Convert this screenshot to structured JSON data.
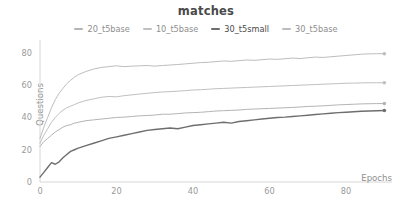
{
  "chart_data": {
    "type": "line",
    "title": "matches",
    "xlabel": "Epochs",
    "ylabel": "Questions",
    "xlim": [
      0,
      92
    ],
    "ylim": [
      0,
      88
    ],
    "xticks": [
      0,
      20,
      40,
      60,
      80
    ],
    "yticks": [
      0,
      20,
      40,
      60,
      80
    ],
    "grid": false,
    "legend_position": "top-center",
    "endpoint_markers": true,
    "series": [
      {
        "name": "20_t5base",
        "color": "#b4b4b4",
        "width": 1.0,
        "x": [
          0,
          1,
          2,
          3,
          4,
          5,
          6,
          7,
          8,
          9,
          10,
          12,
          14,
          16,
          18,
          20,
          22,
          24,
          26,
          28,
          30,
          32,
          34,
          36,
          38,
          40,
          42,
          44,
          46,
          48,
          50,
          52,
          54,
          56,
          58,
          60,
          62,
          64,
          66,
          68,
          70,
          72,
          74,
          76,
          78,
          80,
          82,
          84,
          86,
          88,
          90
        ],
        "values": [
          22,
          25,
          27,
          29,
          31,
          32.5,
          34,
          35,
          35.5,
          36.5,
          37,
          38,
          38.5,
          39,
          39.5,
          40,
          40.2,
          40.6,
          41,
          41.2,
          41.5,
          42,
          42,
          42.4,
          42.8,
          43,
          43.2,
          43.6,
          44,
          44.2,
          44.4,
          44.6,
          45,
          45.2,
          45.4,
          45.6,
          45.8,
          46,
          46.2,
          46.5,
          46.8,
          47,
          47.2,
          47.5,
          47.8,
          48,
          48.2,
          48.4,
          48.5,
          48.6,
          48.6
        ]
      },
      {
        "name": "10_t5base",
        "color": "#c0c0c0",
        "width": 1.0,
        "x": [
          0,
          1,
          2,
          3,
          4,
          5,
          6,
          7,
          8,
          9,
          10,
          12,
          14,
          16,
          18,
          20,
          22,
          24,
          26,
          28,
          30,
          32,
          34,
          36,
          38,
          40,
          42,
          44,
          46,
          48,
          50,
          52,
          54,
          56,
          58,
          60,
          62,
          64,
          66,
          68,
          70,
          72,
          74,
          76,
          78,
          80,
          82,
          84,
          86,
          88,
          90
        ],
        "values": [
          24,
          29,
          33,
          37,
          40,
          42.5,
          44.5,
          46,
          47,
          48,
          49,
          50.5,
          51.5,
          52.5,
          53,
          52.8,
          53.5,
          54,
          54.5,
          55,
          55.4,
          55.8,
          56,
          56.3,
          56.6,
          57,
          57.2,
          57.5,
          57.8,
          58,
          58.2,
          58.4,
          58.6,
          58.8,
          59,
          59.2,
          59.4,
          59.6,
          59.8,
          60,
          60.2,
          60.4,
          60.6,
          60.8,
          61,
          61.2,
          61.3,
          61.4,
          61.5,
          61.5,
          61.5
        ]
      },
      {
        "name": "30_t5small",
        "color": "#6e6e6e",
        "width": 1.4,
        "x": [
          0,
          1,
          2,
          3,
          4,
          5,
          6,
          7,
          8,
          9,
          10,
          12,
          14,
          16,
          18,
          20,
          22,
          24,
          26,
          28,
          30,
          32,
          34,
          36,
          38,
          40,
          42,
          44,
          46,
          48,
          50,
          52,
          54,
          56,
          58,
          60,
          62,
          64,
          66,
          68,
          70,
          72,
          74,
          76,
          78,
          80,
          82,
          84,
          86,
          88,
          90
        ],
        "values": [
          3,
          6,
          9,
          12,
          11,
          12.5,
          15,
          17,
          19,
          20,
          21,
          22.5,
          24,
          25.5,
          27,
          28,
          29,
          30,
          31,
          32,
          32.5,
          33,
          33.5,
          33,
          34,
          35,
          35.5,
          36,
          36.5,
          37,
          36.5,
          37.5,
          38,
          38.5,
          39,
          39.5,
          40,
          40.2,
          40.6,
          41,
          41.4,
          41.8,
          42.2,
          42.6,
          43,
          43.2,
          43.5,
          43.8,
          44,
          44.2,
          44.3
        ]
      },
      {
        "name": "30_t5base",
        "color": "#bdbdbd",
        "width": 1.0,
        "x": [
          0,
          1,
          2,
          3,
          4,
          5,
          6,
          7,
          8,
          9,
          10,
          12,
          14,
          16,
          18,
          20,
          22,
          24,
          26,
          28,
          30,
          32,
          34,
          36,
          38,
          40,
          42,
          44,
          46,
          48,
          50,
          52,
          54,
          56,
          58,
          60,
          62,
          64,
          66,
          68,
          70,
          72,
          74,
          76,
          78,
          80,
          82,
          84,
          86,
          88,
          90
        ],
        "values": [
          27,
          34,
          40,
          46,
          51,
          55,
          58,
          61,
          63,
          65,
          66.5,
          68.5,
          70,
          71,
          71.5,
          72,
          71.5,
          71.8,
          72,
          72.2,
          71.8,
          72.2,
          72.5,
          72.8,
          73.2,
          73.6,
          74,
          74.2,
          74.6,
          75,
          74.8,
          75.2,
          75.6,
          75.4,
          75.8,
          76.2,
          76,
          76.4,
          76.8,
          76.5,
          77,
          77.4,
          77.2,
          77.6,
          78,
          78.4,
          78.8,
          79.2,
          79.4,
          79.5,
          79.5
        ]
      }
    ]
  },
  "legend": {
    "items": [
      {
        "label": "20_t5base"
      },
      {
        "label": "10_t5base"
      },
      {
        "label": "30_t5small"
      },
      {
        "label": "30_t5base"
      }
    ]
  }
}
